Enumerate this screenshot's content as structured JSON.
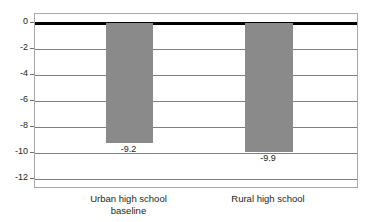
{
  "chart_data": {
    "type": "bar",
    "title": "",
    "subtitle": "",
    "xlabel": "",
    "ylabel": "",
    "categories": [
      "Urban high school\nbaseline",
      "Rural high school"
    ],
    "values": [
      -9.2,
      -9.9
    ],
    "data_labels": [
      "-9.2",
      "-9.9"
    ],
    "ylim": [
      -12,
      0
    ],
    "yticks": [
      0,
      -2,
      -4,
      -6,
      -8,
      -10,
      -12
    ],
    "ytick_labels": [
      "0",
      "-2",
      "-4",
      "-6",
      "-8",
      "-10",
      "-12"
    ],
    "grid": true,
    "legend": false,
    "legend_position": "none",
    "series": [
      {
        "name": "",
        "values": [
          -9.2,
          -9.9
        ]
      }
    ],
    "colors": {
      "bar_fill": "#8a8a8a",
      "zero_line": "#000000",
      "gridline": "#808080",
      "plot_border": "#a8a8a8",
      "text": "#231f20",
      "background": "#ffffff"
    }
  }
}
